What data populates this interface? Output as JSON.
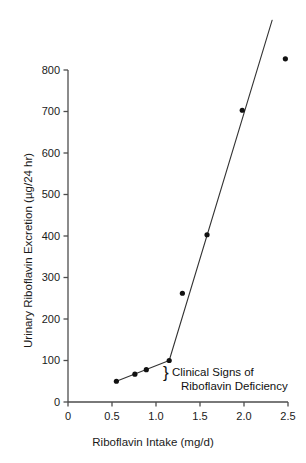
{
  "chart_data": {
    "type": "line",
    "title": "",
    "xlabel": "Riboflavin Intake (mg/d)",
    "ylabel": "Urinary Riboflavin Excretion (µg/24 hr)",
    "xlim": [
      0,
      2.5
    ],
    "ylim": [
      0,
      860
    ],
    "grid": false,
    "legend": "none",
    "xticks": [
      "0",
      "0.5",
      "1.0",
      "1.5",
      "2.0",
      "2.5"
    ],
    "xtick_values": [
      0,
      0.5,
      1.0,
      1.5,
      2.0,
      2.5
    ],
    "yticks": [
      "0",
      "100",
      "200",
      "300",
      "400",
      "500",
      "600",
      "700",
      "800"
    ],
    "ytick_values": [
      0,
      100,
      200,
      300,
      400,
      500,
      600,
      700,
      800
    ],
    "series": [
      {
        "name": "Urinary riboflavin excretion",
        "marker": "filled-circle",
        "marker_color": "#111111",
        "line_color": "#333333",
        "x": [
          0.55,
          0.76,
          0.89,
          1.15,
          1.3,
          1.58,
          1.98,
          2.47
        ],
        "y": [
          50,
          67,
          78,
          100,
          262,
          403,
          703,
          827
        ]
      }
    ],
    "fit_segments": [
      {
        "name": "deficiency-segment",
        "x": [
          0.55,
          1.15
        ],
        "y": [
          50,
          100
        ]
      },
      {
        "name": "repletion-segment",
        "x": [
          1.15,
          2.32
        ],
        "y": [
          100,
          920
        ]
      }
    ],
    "annotations": [
      {
        "name": "clinical-signs-annotation",
        "brace": "}",
        "line1": "Clinical Signs of",
        "line2": "Riboflavin Deficiency"
      }
    ]
  },
  "axis": {
    "x_title": "Riboflavin Intake (mg/d)",
    "y_title": "Urinary Riboflavin Excretion (µg/24 hr)"
  },
  "annotation": {
    "brace": "}",
    "line1": "Clinical Signs of",
    "line2": "Riboflavin Deficiency"
  },
  "colors": {
    "axis": "#4d4d4d",
    "marker": "#111111",
    "line": "#333333",
    "text": "#1a1a1a",
    "background": "#ffffff"
  }
}
